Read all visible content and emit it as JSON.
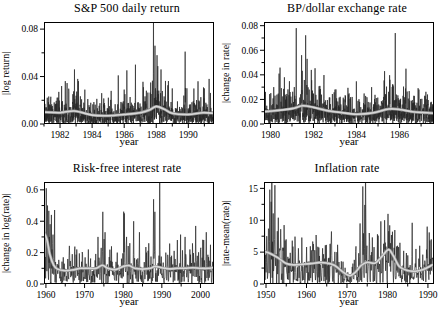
{
  "figure": {
    "layout": "2x2 grid",
    "grid": "off",
    "legend": "none"
  },
  "style": {
    "background": "#ffffff",
    "axis_color": "#000000",
    "text_color": "#000000",
    "series_color": "#262626",
    "trend_color_outer": "#8f8f8f",
    "trend_color_inner": "#d8d8d8"
  },
  "chart_data": [
    {
      "id": "sp500",
      "type": "line",
      "title": "S&P 500 daily return",
      "xlabel": "year",
      "ylabel": "|log return|",
      "xlim": [
        1981.0,
        1991.6
      ],
      "ylim": [
        0,
        0.086
      ],
      "xticks_major": [
        1982,
        1984,
        1986,
        1988,
        1990
      ],
      "xtick_minor_step": 1,
      "yticks_major": [
        0.0,
        0.04,
        0.08
      ],
      "yticks_minor": [
        0.02,
        0.06
      ],
      "y_decimals": 2,
      "series_names": [
        "absolute daily log return",
        "smoothed volatility trend"
      ],
      "trend": [
        [
          1981,
          0.01
        ],
        [
          1982,
          0.0095
        ],
        [
          1982.9,
          0.011
        ],
        [
          1984,
          0.0075
        ],
        [
          1985,
          0.007
        ],
        [
          1986,
          0.008
        ],
        [
          1987,
          0.0095
        ],
        [
          1987.6,
          0.012
        ],
        [
          1988,
          0.0148
        ],
        [
          1988.5,
          0.0125
        ],
        [
          1989,
          0.009
        ],
        [
          1990,
          0.008
        ],
        [
          1990.9,
          0.0095
        ],
        [
          1991.6,
          0.009
        ]
      ],
      "spikes": [
        [
          1982.1,
          0.032
        ],
        [
          1982.9,
          0.046
        ],
        [
          1983.1,
          0.038
        ],
        [
          1984.6,
          0.026
        ],
        [
          1986.0,
          0.029
        ],
        [
          1986.7,
          0.05
        ],
        [
          1987.2,
          0.031
        ],
        [
          1987.83,
          0.095
        ],
        [
          1987.92,
          0.066
        ],
        [
          1988.05,
          0.058
        ],
        [
          1988.3,
          0.046
        ],
        [
          1989.0,
          0.03
        ],
        [
          1989.8,
          0.061
        ],
        [
          1990.6,
          0.036
        ],
        [
          1991.0,
          0.03
        ],
        [
          1991.3,
          0.038
        ]
      ],
      "synth": {
        "n_points": 1150,
        "seed": 7,
        "noise_scale": 1.1,
        "tail_prob": 0.02
      }
    },
    {
      "id": "bp-dollar",
      "type": "line",
      "title": "BP/dollar exchange rate",
      "xlabel": "year",
      "ylabel": "|change in rate|",
      "xlim": [
        1979.7,
        1987.6
      ],
      "ylim": [
        0,
        0.083
      ],
      "xticks_major": [
        1980,
        1982,
        1984,
        1986
      ],
      "xtick_minor_step": 1,
      "yticks_major": [
        0.0,
        0.02,
        0.04,
        0.06,
        0.08
      ],
      "yticks_minor": [
        0.01,
        0.03,
        0.05,
        0.07
      ],
      "y_decimals": 2,
      "series_names": [
        "absolute daily change in rate",
        "smoothed volatility trend"
      ],
      "trend": [
        [
          1979.7,
          0.01
        ],
        [
          1980.3,
          0.011
        ],
        [
          1981.0,
          0.0125
        ],
        [
          1981.5,
          0.0148
        ],
        [
          1982.0,
          0.0135
        ],
        [
          1982.6,
          0.011
        ],
        [
          1983.2,
          0.0095
        ],
        [
          1984.0,
          0.008
        ],
        [
          1984.8,
          0.0092
        ],
        [
          1985.5,
          0.0122
        ],
        [
          1986.0,
          0.0118
        ],
        [
          1986.6,
          0.01
        ],
        [
          1987.6,
          0.0088
        ]
      ],
      "spikes": [
        [
          1980.15,
          0.03
        ],
        [
          1980.4,
          0.041
        ],
        [
          1980.65,
          0.038
        ],
        [
          1981.2,
          0.078
        ],
        [
          1981.45,
          0.056
        ],
        [
          1981.7,
          0.053
        ],
        [
          1981.9,
          0.044
        ],
        [
          1982.3,
          0.031
        ],
        [
          1983.0,
          0.028
        ],
        [
          1983.8,
          0.022
        ],
        [
          1984.7,
          0.03
        ],
        [
          1985.3,
          0.043
        ],
        [
          1985.55,
          0.036
        ],
        [
          1985.8,
          0.074
        ],
        [
          1986.3,
          0.045
        ],
        [
          1986.9,
          0.028
        ],
        [
          1987.3,
          0.024
        ]
      ],
      "synth": {
        "n_points": 1050,
        "seed": 13,
        "noise_scale": 1.1,
        "tail_prob": 0.02
      }
    },
    {
      "id": "riskfree",
      "type": "line",
      "title": "Risk-free interest rate",
      "xlabel": "year",
      "ylabel": "|change in log(rate)|",
      "xlim": [
        1959.5,
        2003.5
      ],
      "ylim": [
        0,
        0.65
      ],
      "xticks_major": [
        1960,
        1970,
        1980,
        1990,
        2000
      ],
      "xtick_minor_step": 5,
      "yticks_major": [
        0.0,
        0.2,
        0.4,
        0.6
      ],
      "yticks_minor": [
        0.1,
        0.3,
        0.5
      ],
      "y_decimals": 1,
      "series_names": [
        "absolute change in log rate",
        "smoothed volatility trend"
      ],
      "trend": [
        [
          1959.5,
          0.33
        ],
        [
          1960.3,
          0.28
        ],
        [
          1961,
          0.19
        ],
        [
          1962,
          0.12
        ],
        [
          1963,
          0.095
        ],
        [
          1965,
          0.085
        ],
        [
          1967,
          0.09
        ],
        [
          1969,
          0.1
        ],
        [
          1971,
          0.1
        ],
        [
          1973,
          0.1
        ],
        [
          1974.6,
          0.12
        ],
        [
          1976,
          0.1
        ],
        [
          1978,
          0.092
        ],
        [
          1980,
          0.112
        ],
        [
          1981.5,
          0.118
        ],
        [
          1983,
          0.1
        ],
        [
          1985,
          0.095
        ],
        [
          1987,
          0.1
        ],
        [
          1988.2,
          0.112
        ],
        [
          1990,
          0.104
        ],
        [
          1992,
          0.096
        ],
        [
          1994,
          0.1
        ],
        [
          1996,
          0.1
        ],
        [
          1998,
          0.104
        ],
        [
          2000,
          0.1
        ],
        [
          2002,
          0.1
        ],
        [
          2003.5,
          0.106
        ]
      ],
      "spikes": [
        [
          1960.1,
          0.61
        ],
        [
          1960.45,
          0.5
        ],
        [
          1960.9,
          0.3
        ],
        [
          1961.6,
          0.22
        ],
        [
          1964.5,
          0.17
        ],
        [
          1966.8,
          0.19
        ],
        [
          1968.0,
          0.22
        ],
        [
          1969.5,
          0.19
        ],
        [
          1971.0,
          0.22
        ],
        [
          1973.5,
          0.3
        ],
        [
          1974.7,
          0.46
        ],
        [
          1975.3,
          0.33
        ],
        [
          1977.0,
          0.24
        ],
        [
          1978.5,
          0.2
        ],
        [
          1980.3,
          0.45
        ],
        [
          1980.9,
          0.3
        ],
        [
          1981.7,
          0.26
        ],
        [
          1982.7,
          0.4
        ],
        [
          1984.2,
          0.33
        ],
        [
          1986.0,
          0.2
        ],
        [
          1987.85,
          0.54
        ],
        [
          1988.2,
          0.46
        ],
        [
          1989.5,
          0.22
        ],
        [
          1991.0,
          0.2
        ],
        [
          1992.5,
          0.18
        ],
        [
          1994.0,
          0.28
        ],
        [
          1996.0,
          0.3
        ],
        [
          1997.3,
          0.22
        ],
        [
          1998.8,
          0.37
        ],
        [
          2000.0,
          0.22
        ],
        [
          2000.8,
          0.28
        ],
        [
          2001.5,
          0.33
        ],
        [
          2002.6,
          0.25
        ]
      ],
      "synth": {
        "n_points": 530,
        "seed": 21,
        "noise_scale": 1.05,
        "tail_prob": 0.03
      }
    },
    {
      "id": "inflation",
      "type": "line",
      "title": "Inflation rate",
      "xlabel": "year",
      "ylabel": "|rate-mean(rate)|",
      "xlim": [
        1949.5,
        1991.5
      ],
      "ylim": [
        0,
        16
      ],
      "xticks_major": [
        1950,
        1960,
        1970,
        1980,
        1990
      ],
      "xtick_minor_step": 5,
      "yticks_major": [
        0,
        5,
        10,
        15
      ],
      "yticks_minor": [
        2.5,
        7.5,
        12.5
      ],
      "y_decimals": 0,
      "series_names": [
        "absolute deviation of rate from mean",
        "smoothed volatility trend"
      ],
      "trend": [
        [
          1949.5,
          5.1
        ],
        [
          1951,
          4.8
        ],
        [
          1953,
          4.1
        ],
        [
          1955,
          3.2
        ],
        [
          1957,
          3.0
        ],
        [
          1959,
          3.1
        ],
        [
          1961,
          3.2
        ],
        [
          1963,
          3.35
        ],
        [
          1965,
          3.3
        ],
        [
          1967,
          2.9
        ],
        [
          1969,
          1.9
        ],
        [
          1970.7,
          1.3
        ],
        [
          1972,
          1.8
        ],
        [
          1973.5,
          2.9
        ],
        [
          1975,
          3.4
        ],
        [
          1977,
          3.3
        ],
        [
          1979,
          4.6
        ],
        [
          1980.3,
          5.4
        ],
        [
          1981.5,
          4.4
        ],
        [
          1983,
          2.7
        ],
        [
          1985,
          2.1
        ],
        [
          1987,
          2.0
        ],
        [
          1989,
          2.3
        ],
        [
          1990.5,
          2.8
        ],
        [
          1991.5,
          3.1
        ]
      ],
      "spikes": [
        [
          1950.2,
          7.5
        ],
        [
          1950.9,
          14.8
        ],
        [
          1951.3,
          12.9
        ],
        [
          1952.2,
          15.5
        ],
        [
          1953.0,
          10.4
        ],
        [
          1953.6,
          8.6
        ],
        [
          1955.0,
          7.0
        ],
        [
          1956.5,
          6.8
        ],
        [
          1958.0,
          5.6
        ],
        [
          1960.0,
          5.8
        ],
        [
          1962.0,
          5.3
        ],
        [
          1964.0,
          5.6
        ],
        [
          1966.0,
          6.2
        ],
        [
          1967.5,
          5.0
        ],
        [
          1969.0,
          3.5
        ],
        [
          1971.5,
          3.2
        ],
        [
          1973.2,
          9.5
        ],
        [
          1973.95,
          15.3
        ],
        [
          1974.4,
          12.4
        ],
        [
          1975.5,
          8.0
        ],
        [
          1976.3,
          7.3
        ],
        [
          1977.5,
          7.8
        ],
        [
          1979.3,
          10.0
        ],
        [
          1980.1,
          11.0
        ],
        [
          1980.6,
          9.2
        ],
        [
          1981.2,
          8.2
        ],
        [
          1982.5,
          6.0
        ],
        [
          1984.0,
          5.2
        ],
        [
          1986.1,
          9.6
        ],
        [
          1987.0,
          5.5
        ],
        [
          1988.0,
          6.0
        ],
        [
          1989.8,
          9.0
        ],
        [
          1990.8,
          7.0
        ]
      ],
      "synth": {
        "n_points": 500,
        "seed": 33,
        "noise_scale": 1.05,
        "tail_prob": 0.03
      }
    }
  ]
}
